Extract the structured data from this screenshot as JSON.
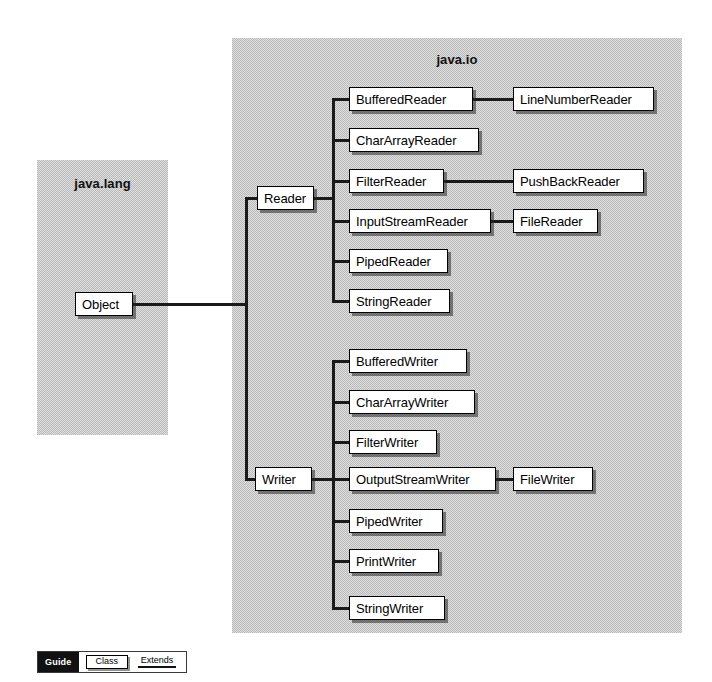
{
  "diagram": {
    "root_class": "Object",
    "packages": [
      {
        "name": "java.lang",
        "label": "java.lang"
      },
      {
        "name": "java.io",
        "label": "java.io"
      }
    ],
    "nodes": {
      "object": "Object",
      "reader": "Reader",
      "writer": "Writer",
      "reader_subclasses": [
        "BufferedReader",
        "CharArrayReader",
        "FilterReader",
        "InputStreamReader",
        "PipedReader",
        "StringReader"
      ],
      "reader_leaves": [
        "LineNumberReader",
        "PushBackReader",
        "FileReader"
      ],
      "writer_subclasses": [
        "BufferedWriter",
        "CharArrayWriter",
        "FilterWriter",
        "OutputStreamWriter",
        "PipedWriter",
        "PrintWriter",
        "StringWriter"
      ],
      "writer_leaves": [
        "FileWriter"
      ]
    },
    "relations": [
      {
        "parent": "Object",
        "child": "Reader"
      },
      {
        "parent": "Object",
        "child": "Writer"
      },
      {
        "parent": "Reader",
        "child": "BufferedReader"
      },
      {
        "parent": "Reader",
        "child": "CharArrayReader"
      },
      {
        "parent": "Reader",
        "child": "FilterReader"
      },
      {
        "parent": "Reader",
        "child": "InputStreamReader"
      },
      {
        "parent": "Reader",
        "child": "PipedReader"
      },
      {
        "parent": "Reader",
        "child": "StringReader"
      },
      {
        "parent": "BufferedReader",
        "child": "LineNumberReader"
      },
      {
        "parent": "FilterReader",
        "child": "PushBackReader"
      },
      {
        "parent": "InputStreamReader",
        "child": "FileReader"
      },
      {
        "parent": "Writer",
        "child": "BufferedWriter"
      },
      {
        "parent": "Writer",
        "child": "CharArrayWriter"
      },
      {
        "parent": "Writer",
        "child": "FilterWriter"
      },
      {
        "parent": "Writer",
        "child": "OutputStreamWriter"
      },
      {
        "parent": "Writer",
        "child": "PipedWriter"
      },
      {
        "parent": "Writer",
        "child": "PrintWriter"
      },
      {
        "parent": "Writer",
        "child": "StringWriter"
      },
      {
        "parent": "OutputStreamWriter",
        "child": "FileWriter"
      }
    ]
  },
  "legend": {
    "guide_label": "Guide",
    "class_label": "Class",
    "extends_label": "Extends"
  },
  "colors": {
    "package_fill": "#b9b9b9",
    "node_fill": "#ffffff",
    "line": "#1a1a1a",
    "text": "#000000",
    "legend_bar": "#111111",
    "page_background": "#ffffff"
  }
}
